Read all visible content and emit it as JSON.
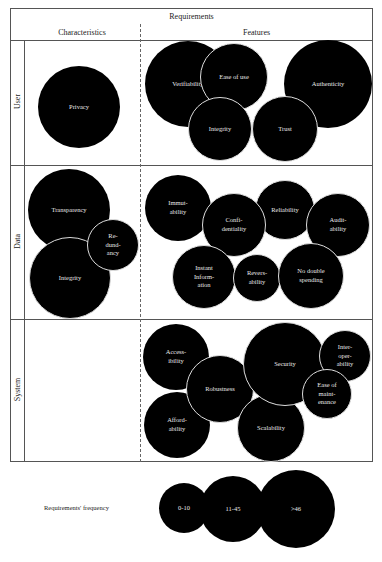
{
  "header": {
    "title": "Requirements",
    "left_column": "Characteristics",
    "right_column": "Features"
  },
  "rows": [
    {
      "label": "User"
    },
    {
      "label": "Data"
    },
    {
      "label": "System"
    }
  ],
  "bubbles": {
    "user_characteristics": [
      {
        "label": "Privacy",
        "x": 79,
        "y": 107,
        "r": 41
      }
    ],
    "user_features": [
      {
        "label": "Verifiability",
        "x": 188,
        "y": 84,
        "r": 43
      },
      {
        "label": "Authenticity",
        "x": 328,
        "y": 84,
        "r": 44
      },
      {
        "label": "Ease of use",
        "x": 234,
        "y": 77,
        "r": 34
      },
      {
        "label": "Integrity",
        "x": 220,
        "y": 129,
        "r": 32
      },
      {
        "label": "Trust",
        "x": 285,
        "y": 129,
        "r": 33
      }
    ],
    "data_characteristics": [
      {
        "label": "Transparency",
        "x": 69,
        "y": 210,
        "r": 41
      },
      {
        "label": "Integrity",
        "x": 70,
        "y": 278,
        "r": 41
      },
      {
        "label": "Re-\ndund-\nancy",
        "x": 113,
        "y": 245,
        "r": 26
      }
    ],
    "data_features": [
      {
        "label": "Immut-\nability",
        "x": 178,
        "y": 208,
        "r": 33
      },
      {
        "label": "Reliability",
        "x": 285,
        "y": 210,
        "r": 30
      },
      {
        "label": "Confi-\ndentiality",
        "x": 234,
        "y": 225,
        "r": 32
      },
      {
        "label": "Audit-\nability",
        "x": 338,
        "y": 225,
        "r": 32
      },
      {
        "label": "Instant\nInform-\nation",
        "x": 204,
        "y": 277,
        "r": 32
      },
      {
        "label": "Revers-\nability",
        "x": 257,
        "y": 278,
        "r": 24
      },
      {
        "label": "No double\nspending",
        "x": 311,
        "y": 276,
        "r": 33
      }
    ],
    "system_features": [
      {
        "label": "Access-\nibility",
        "x": 176,
        "y": 357,
        "r": 33
      },
      {
        "label": "Afford-\nability",
        "x": 177,
        "y": 425,
        "r": 33
      },
      {
        "label": "Robustness",
        "x": 220,
        "y": 389,
        "r": 34
      },
      {
        "label": "Scalability",
        "x": 271,
        "y": 428,
        "r": 34
      },
      {
        "label": "Security",
        "x": 285,
        "y": 364,
        "r": 42
      },
      {
        "label": "Inter-\noper-\nability",
        "x": 345,
        "y": 356,
        "r": 26
      },
      {
        "label": "Ease of\nmaint-\nenance",
        "x": 327,
        "y": 394,
        "r": 25
      }
    ]
  },
  "legend": {
    "title": "Requirements' frequency",
    "items": [
      {
        "label": "0-10",
        "x": 184,
        "y": 508,
        "r": 25
      },
      {
        "label": "11-45",
        "x": 233,
        "y": 509,
        "r": 33
      },
      {
        "label": ">46",
        "x": 296,
        "y": 509,
        "r": 39
      }
    ]
  }
}
